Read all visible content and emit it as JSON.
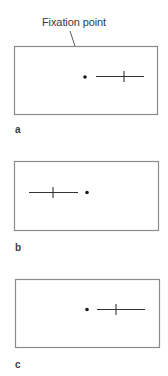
{
  "figure": {
    "callout": {
      "label": "Fixation point"
    },
    "panels": [
      {
        "id": "a",
        "label": "a",
        "box": {
          "x": 14,
          "y": 46,
          "w": 144,
          "h": 69
        },
        "fixation_dot": {
          "x": 85,
          "y": 77
        },
        "line": {
          "x1": 96,
          "x2": 144,
          "y": 76
        },
        "tick_x": 124
      },
      {
        "id": "b",
        "label": "b",
        "box": {
          "x": 14,
          "y": 161,
          "w": 145,
          "h": 70
        },
        "fixation_dot": {
          "x": 87,
          "y": 192
        },
        "line": {
          "x1": 29,
          "x2": 78,
          "y": 192
        },
        "tick_x": 53
      },
      {
        "id": "c",
        "label": "c",
        "box": {
          "x": 15,
          "y": 279,
          "w": 145,
          "h": 69
        },
        "fixation_dot": {
          "x": 87,
          "y": 309
        },
        "line": {
          "x1": 97,
          "x2": 145,
          "y": 309
        },
        "tick_x": 116
      }
    ],
    "colors": {
      "box_stroke": "#8a8a8a",
      "line_stroke": "#333333",
      "dot_fill": "#1a1a1a",
      "text": "#3a3a3a"
    }
  }
}
